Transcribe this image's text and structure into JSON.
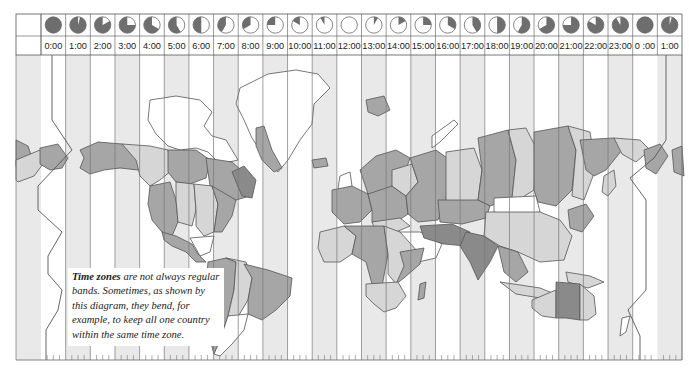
{
  "header": {
    "hours": [
      {
        "label": "0:00",
        "dark_fraction": 1.0
      },
      {
        "label": "1:00",
        "dark_fraction": 0.958
      },
      {
        "label": "2:00",
        "dark_fraction": 0.833
      },
      {
        "label": "3:00",
        "dark_fraction": 0.75
      },
      {
        "label": "4:00",
        "dark_fraction": 0.667
      },
      {
        "label": "5:00",
        "dark_fraction": 0.583
      },
      {
        "label": "6:00",
        "dark_fraction": 0.5
      },
      {
        "label": "7:00",
        "dark_fraction": 0.417
      },
      {
        "label": "8:00",
        "dark_fraction": 0.333
      },
      {
        "label": "9:00",
        "dark_fraction": 0.25
      },
      {
        "label": "10:00",
        "dark_fraction": 0.167
      },
      {
        "label": "11:00",
        "dark_fraction": 0.083
      },
      {
        "label": "12:00",
        "dark_fraction": 0.0
      },
      {
        "label": "13:00",
        "dark_fraction": 0.083
      },
      {
        "label": "14:00",
        "dark_fraction": 0.167
      },
      {
        "label": "15:00",
        "dark_fraction": 0.25
      },
      {
        "label": "16:00",
        "dark_fraction": 0.333
      },
      {
        "label": "17:00",
        "dark_fraction": 0.417
      },
      {
        "label": "18:00",
        "dark_fraction": 0.5
      },
      {
        "label": "19:00",
        "dark_fraction": 0.583
      },
      {
        "label": "20:00",
        "dark_fraction": 0.667
      },
      {
        "label": "21:00",
        "dark_fraction": 0.75
      },
      {
        "label": "22:00",
        "dark_fraction": 0.833
      },
      {
        "label": "23:00",
        "dark_fraction": 0.917
      },
      {
        "label": "0 :00",
        "dark_fraction": 1.0
      },
      {
        "label": "1:00",
        "dark_fraction": 0.958
      }
    ]
  },
  "caption": {
    "bold": "Time zones",
    "text": " are not always regular bands. Sometimes, as shown by this diagram, they bend, for example, to keep all one country within the same time zone."
  },
  "colors": {
    "band_shaded": "#e9e9e9",
    "band_white": "#ffffff",
    "land_light": "#d6d6d6",
    "land_mid": "#a6a6a6",
    "land_dark": "#8a8a8a",
    "clock_dark": "#6e6e6e",
    "line": "#555555"
  }
}
